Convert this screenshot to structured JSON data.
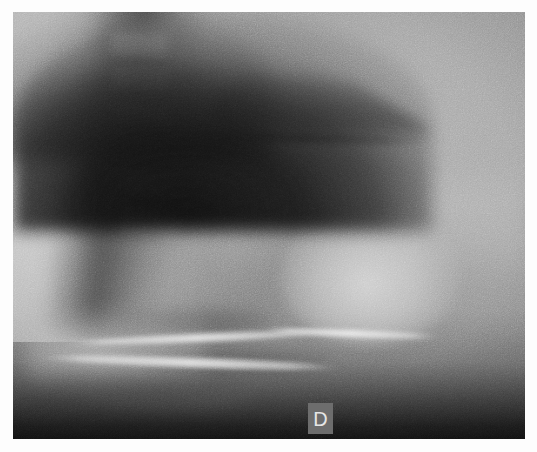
{
  "image": {
    "modality": "radiograph",
    "view": "lateral soft-tissue neck / cervical spine",
    "orientation": "profile facing right",
    "background_color": "#ffffff",
    "film_border_color": "#ffffff",
    "film_base_color": "#9a9a9a"
  },
  "marker": {
    "name": "side-marker",
    "letter": "D",
    "meaning": "droite / right side laterality marker",
    "box_color": "#6d6d6d",
    "letter_color": "#e6e6e6",
    "position": "lower centre, over dense shoulder shadow"
  },
  "anatomy": [
    {
      "id": "posterior-band",
      "label": "posterior soft-tissue / paraspinal shadow",
      "density": "dark"
    },
    {
      "id": "vertebral-column",
      "label": "cervical vertebral bodies",
      "density": "mid-grey"
    },
    {
      "id": "posterior-elements",
      "label": "posterior vertebral elements",
      "density": "dark"
    },
    {
      "id": "air-wedge",
      "label": "pharyngeal air column (dark wedge)",
      "density": "very dark"
    },
    {
      "id": "bright-mass",
      "label": "rounded radio-opaque soft-tissue mass",
      "density": "bright"
    },
    {
      "id": "bright-lines",
      "label": "curvilinear bony cortical margins",
      "density": "very bright"
    },
    {
      "id": "shoulder-mass",
      "label": "dense shoulder / upper thorax shadow",
      "density": "black"
    }
  ],
  "vertebrae": [
    {
      "top": 22,
      "left": 98,
      "w": 56,
      "h": 24
    },
    {
      "top": 56,
      "left": 100,
      "w": 56,
      "h": 24
    },
    {
      "top": 90,
      "left": 102,
      "w": 56,
      "h": 24
    },
    {
      "top": 124,
      "left": 104,
      "w": 56,
      "h": 24
    },
    {
      "top": 158,
      "left": 106,
      "w": 58,
      "h": 26
    },
    {
      "top": 196,
      "left": 108,
      "w": 58,
      "h": 26
    }
  ],
  "discs": [
    {
      "top": 48,
      "left": 100,
      "w": 54,
      "h": 7
    },
    {
      "top": 82,
      "left": 102,
      "w": 54,
      "h": 7
    },
    {
      "top": 116,
      "left": 104,
      "w": 54,
      "h": 7
    },
    {
      "top": 150,
      "left": 106,
      "w": 54,
      "h": 7
    },
    {
      "top": 186,
      "left": 108,
      "w": 56,
      "h": 8
    }
  ]
}
